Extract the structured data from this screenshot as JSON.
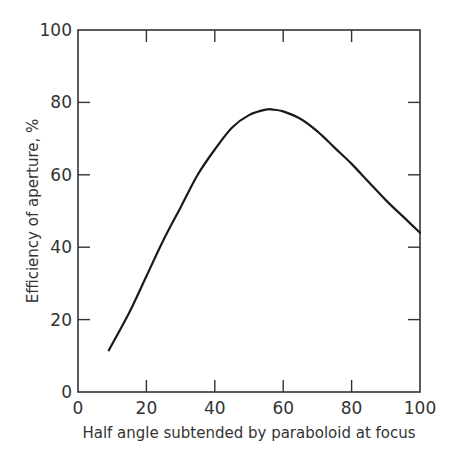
{
  "chart_data": {
    "type": "line",
    "title": "",
    "xlabel": "Half angle subtended by paraboloid at focus",
    "ylabel": "Efficiency of aperture, %",
    "xlim": [
      0,
      100
    ],
    "ylim": [
      0,
      100
    ],
    "x_ticks": [
      "0",
      "20",
      "40",
      "60",
      "80",
      "100"
    ],
    "y_ticks": [
      "0",
      "20",
      "40",
      "60",
      "80",
      "100"
    ],
    "grid": false,
    "legend": null,
    "series": [
      {
        "name": "Aperture efficiency",
        "x": [
          9,
          15,
          20,
          25,
          30,
          35,
          40,
          45,
          50,
          55,
          57,
          60,
          65,
          70,
          75,
          80,
          85,
          90,
          95,
          100
        ],
        "y": [
          11.5,
          22,
          32,
          42,
          51,
          60,
          67,
          73,
          76.5,
          78,
          78,
          77.5,
          75.5,
          72,
          67.5,
          63,
          58,
          53,
          48.5,
          44
        ]
      }
    ]
  },
  "labels": {
    "xlabel": "Half angle subtended by paraboloid at focus",
    "ylabel": "Efficiency of aperture, %",
    "x_ticks": [
      "0",
      "20",
      "40",
      "60",
      "80",
      "100"
    ],
    "y_ticks": [
      "0",
      "20",
      "40",
      "60",
      "80",
      "100"
    ]
  }
}
